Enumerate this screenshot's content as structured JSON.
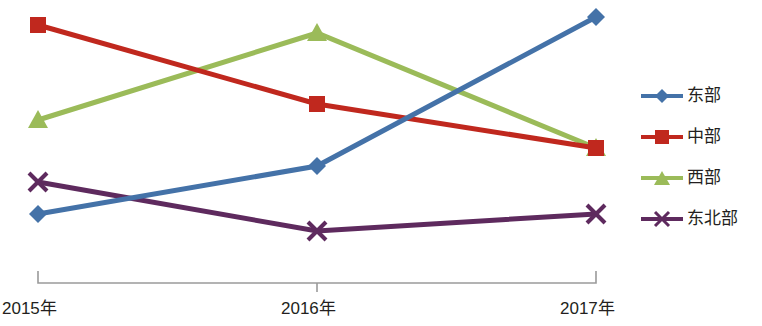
{
  "chart_data": {
    "type": "line",
    "title": "",
    "xlabel": "",
    "ylabel": "",
    "grid": false,
    "legend_position": "right",
    "categories": [
      "2015年",
      "2016年",
      "2017年"
    ],
    "axis": {
      "x_tick_labels": [
        "2015年",
        "2016年",
        "2017年"
      ],
      "y_axis_visible": false,
      "y_tick_labels": [],
      "ylim": [
        0,
        100
      ],
      "x_axis_line_color": "#9a9a9a"
    },
    "series": [
      {
        "name": "东部",
        "color": "#4472a8",
        "marker": "diamond",
        "values": [
          26,
          44,
          100
        ]
      },
      {
        "name": "中部",
        "color": "#c0281e",
        "marker": "square",
        "values": [
          97,
          67,
          50
        ]
      },
      {
        "name": "西部",
        "color": "#9bbb59",
        "marker": "triangle",
        "values": [
          61,
          94,
          50
        ]
      },
      {
        "name": "东北部",
        "color": "#5e2a5e",
        "marker": "x",
        "values": [
          38,
          19,
          26
        ]
      }
    ],
    "pixel_points": {
      "x": [
        38,
        317,
        596
      ],
      "东部": [
        214,
        166,
        17
      ],
      "中部": [
        25,
        104,
        148
      ],
      "西部": [
        120,
        33,
        148
      ],
      "东北部": [
        182,
        231,
        214
      ]
    }
  },
  "legend": {
    "items": [
      {
        "label": "东部",
        "color": "#4472a8",
        "marker": "diamond"
      },
      {
        "label": "中部",
        "color": "#c0281e",
        "marker": "square"
      },
      {
        "label": "西部",
        "color": "#9bbb59",
        "marker": "triangle"
      },
      {
        "label": "东北部",
        "color": "#5e2a5e",
        "marker": "x"
      }
    ]
  }
}
